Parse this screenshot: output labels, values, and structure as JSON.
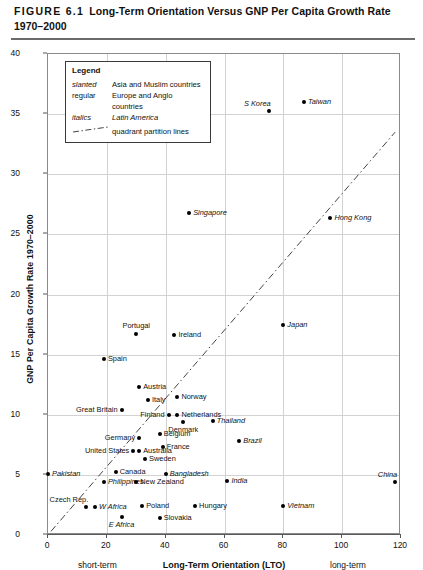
{
  "figure": {
    "number": "FIGURE 6.1",
    "title_line1": "Long-Term Orientation Versus GNP Per Capita Growth Rate",
    "title_line2": "1970–2000"
  },
  "legend": {
    "title": "Legend",
    "rows": [
      {
        "key": "slanted",
        "value": "Asia and Muslim countries",
        "key_style": "slanted",
        "value_style": "regular"
      },
      {
        "key": "regular",
        "value": "Europe and Anglo countries",
        "key_style": "regular",
        "value_style": "regular"
      },
      {
        "key": "italics",
        "value": "Latin America",
        "key_style": "italics",
        "value_style": "italics"
      },
      {
        "key": "",
        "value": "quadrant partition lines",
        "key_style": "dash",
        "value_style": "regular"
      }
    ]
  },
  "chart_data": {
    "type": "scatter",
    "title": "Long-Term Orientation Versus GNP Per Capita Growth Rate 1970–2000",
    "xlabel": "Long-Term Orientation (LTO)",
    "ylabel": "GNP Per Capita Growth Rate 1970–2000",
    "xlim": [
      0,
      120
    ],
    "ylim": [
      0,
      40
    ],
    "xticks": [
      0,
      20,
      40,
      60,
      80,
      100,
      120
    ],
    "yticks": [
      0,
      5,
      10,
      15,
      20,
      25,
      30,
      35,
      40
    ],
    "grid": true,
    "legend_position": "top-left-inside",
    "x_axis_annotations": {
      "left": "short-term",
      "right": "long-term"
    },
    "partition_lines": [
      {
        "name": "diagonal-quadrant-line",
        "x0": 1,
        "y0": 0.3,
        "x1": 118,
        "y1": 33.5,
        "style": "dash-dot"
      }
    ],
    "points": [
      {
        "label": "S Korea",
        "x": 75,
        "y": 35.3,
        "group": "asia",
        "label_pos": "upper-left"
      },
      {
        "label": "Taiwan",
        "x": 87,
        "y": 36.0,
        "group": "asia",
        "label_pos": "right"
      },
      {
        "label": "Singapore",
        "x": 48,
        "y": 26.8,
        "group": "asia",
        "label_pos": "right"
      },
      {
        "label": "Hong Kong",
        "x": 96,
        "y": 26.4,
        "group": "asia",
        "label_pos": "right"
      },
      {
        "label": "Japan",
        "x": 80,
        "y": 17.5,
        "group": "asia",
        "label_pos": "right"
      },
      {
        "label": "Portugal",
        "x": 30,
        "y": 16.7,
        "group": "europe",
        "label_pos": "top"
      },
      {
        "label": "Ireland",
        "x": 43,
        "y": 16.6,
        "group": "europe",
        "label_pos": "right"
      },
      {
        "label": "Spain",
        "x": 19,
        "y": 14.6,
        "group": "europe",
        "label_pos": "right"
      },
      {
        "label": "Austria",
        "x": 31,
        "y": 12.3,
        "group": "europe",
        "label_pos": "right"
      },
      {
        "label": "Norway",
        "x": 44,
        "y": 11.5,
        "group": "europe",
        "label_pos": "right"
      },
      {
        "label": "Italy",
        "x": 34,
        "y": 11.2,
        "group": "europe",
        "label_pos": "right"
      },
      {
        "label": "Great Britain",
        "x": 25,
        "y": 10.4,
        "group": "europe",
        "label_pos": "left"
      },
      {
        "label": "Finland",
        "x": 41,
        "y": 10.0,
        "group": "europe",
        "label_pos": "left"
      },
      {
        "label": "Netherlands",
        "x": 44,
        "y": 10.0,
        "group": "europe",
        "label_pos": "right"
      },
      {
        "label": "Denmark",
        "x": 46,
        "y": 9.4,
        "group": "europe",
        "label_pos": "bottom"
      },
      {
        "label": "Thailand",
        "x": 56,
        "y": 9.5,
        "group": "asia",
        "label_pos": "right"
      },
      {
        "label": "Belgium",
        "x": 38,
        "y": 8.4,
        "group": "europe",
        "label_pos": "right"
      },
      {
        "label": "Germany",
        "x": 31,
        "y": 8.1,
        "group": "europe",
        "label_pos": "left"
      },
      {
        "label": "Brazil",
        "x": 65,
        "y": 7.8,
        "group": "latin",
        "label_pos": "right"
      },
      {
        "label": "France",
        "x": 39,
        "y": 7.3,
        "group": "europe",
        "label_pos": "right"
      },
      {
        "label": "United States",
        "x": 29,
        "y": 7.0,
        "group": "anglo",
        "label_pos": "left"
      },
      {
        "label": "Australia",
        "x": 31,
        "y": 7.0,
        "group": "anglo",
        "label_pos": "right"
      },
      {
        "label": "Sweden",
        "x": 33,
        "y": 6.3,
        "group": "europe",
        "label_pos": "right"
      },
      {
        "label": "Pakistan",
        "x": 0,
        "y": 5.1,
        "group": "muslim",
        "label_pos": "right"
      },
      {
        "label": "Canada",
        "x": 23,
        "y": 5.2,
        "group": "anglo",
        "label_pos": "right"
      },
      {
        "label": "Bangladesh",
        "x": 40,
        "y": 5.1,
        "group": "asia",
        "label_pos": "right"
      },
      {
        "label": "Philippines",
        "x": 19,
        "y": 4.4,
        "group": "asia",
        "label_pos": "right"
      },
      {
        "label": "New Zealand",
        "x": 30,
        "y": 4.4,
        "group": "anglo",
        "label_pos": "right"
      },
      {
        "label": "India",
        "x": 61,
        "y": 4.5,
        "group": "asia",
        "label_pos": "right"
      },
      {
        "label": "China",
        "x": 118,
        "y": 4.4,
        "group": "asia",
        "label_pos": "upper-left"
      },
      {
        "label": "Czech Rep.",
        "x": 13,
        "y": 2.3,
        "group": "europe",
        "label_pos": "upper-left"
      },
      {
        "label": "W Africa",
        "x": 16,
        "y": 2.3,
        "group": "asia",
        "label_pos": "right"
      },
      {
        "label": "Poland",
        "x": 32,
        "y": 2.4,
        "group": "europe",
        "label_pos": "right"
      },
      {
        "label": "Hungary",
        "x": 50,
        "y": 2.4,
        "group": "europe",
        "label_pos": "right"
      },
      {
        "label": "Vietnam",
        "x": 80,
        "y": 2.4,
        "group": "asia",
        "label_pos": "right"
      },
      {
        "label": "E Africa",
        "x": 25,
        "y": 1.5,
        "group": "asia",
        "label_pos": "bottom"
      },
      {
        "label": "Slovakia",
        "x": 38,
        "y": 1.4,
        "group": "europe",
        "label_pos": "right"
      }
    ]
  }
}
